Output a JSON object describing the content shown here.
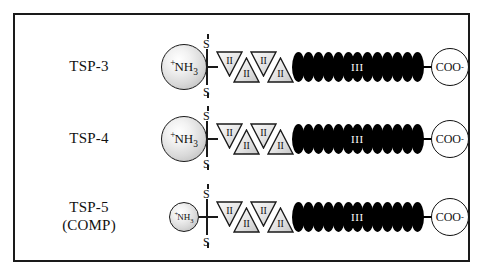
{
  "figure": {
    "background_color": "#ffffff",
    "frame_color": "#1a1a1a"
  },
  "domain_legend": {
    "type_ii_label": "II",
    "type_iii_label": "III",
    "n_terminal_label": "NH",
    "n_terminal_charge": "+",
    "n_terminal_subscript": "3",
    "c_terminal_label": "COO",
    "c_terminal_charge": "-",
    "sulfur_label": "S"
  },
  "rows": [
    {
      "id": "tsp-3",
      "name_line1": "TSP-3",
      "name_line2": "",
      "nterm_size": 46,
      "type_ii_count": 4,
      "type_iii_count": 13
    },
    {
      "id": "tsp-4",
      "name_line1": "TSP-4",
      "name_line2": "",
      "nterm_size": 46,
      "type_ii_count": 4,
      "type_iii_count": 13
    },
    {
      "id": "tsp-5-comp",
      "name_line1": "TSP-5",
      "name_line2": "(COMP)",
      "nterm_size": 30,
      "type_ii_count": 4,
      "type_iii_count": 13
    }
  ]
}
